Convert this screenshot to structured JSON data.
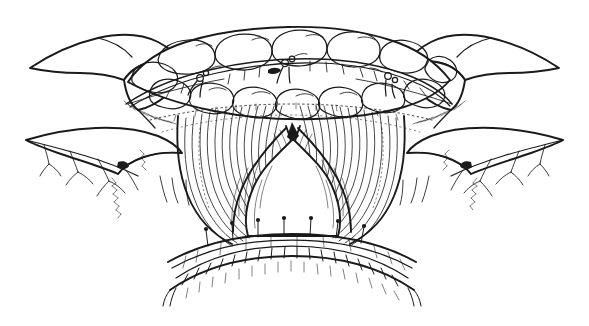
{
  "figure": {
    "kind": "line-art-medical-illustration",
    "background_color": "#ffffff",
    "ink_color": "#1a1a1a",
    "width": 589,
    "height": 326,
    "has_text_labels": false,
    "caption": "",
    "style": "pen-and-ink hatched line drawing, no shading fills, white background"
  },
  "regions": [
    {
      "id": "left-retractor-hand",
      "label": "Left retracting hand / finger pair",
      "description": "Two rounded finger forms entering from the upper-left, gripping and drawing the tissue edge laterally"
    },
    {
      "id": "right-retractor-hand",
      "label": "Right retracting hand / finger pair",
      "description": "Mirror-image rounded finger forms entering from the upper-right, drawing the tissue edge laterally"
    },
    {
      "id": "fat-pad-band",
      "label": "Lobulated fat pad / omental band",
      "description": "Arched band of overlapping rounded lobules spanning the top center of the field"
    },
    {
      "id": "upper-suture-line",
      "label": "Upper running suture with knots",
      "description": "Dark stitched line running through the lobulated band, with three tied knot clusters"
    },
    {
      "id": "muscular-wall",
      "label": "Striated muscular wall",
      "description": "Fan of fine vertical curved fibers descending from the band and sweeping around the opening"
    },
    {
      "id": "central-aperture",
      "label": "Central aperture / hiatus",
      "description": "Dome-shaped white opening at the center of the field with a sharp V-notch at its apex"
    },
    {
      "id": "lower-suture-line",
      "label": "Lower interrupted suture line",
      "description": "Gently arched line across the base of the aperture with upright interrupted stitches"
    },
    {
      "id": "inferior-stitch-ladder",
      "label": "Inferior stitch ladder",
      "description": "Second arched line below, carrying a ladder of rectangular stitch loops along its length"
    },
    {
      "id": "left-vessel-branches",
      "label": "Left branching vessels",
      "description": "Thin branching vessel and septal lines extending to the lower-left margin"
    },
    {
      "id": "right-vessel-branches",
      "label": "Right branching vessels",
      "description": "Thin branching vessel and septal lines extending to the lower-right margin"
    }
  ],
  "geometry": {
    "aperture_apex": [
      295,
      128
    ],
    "aperture_center": [
      292,
      190
    ],
    "aperture_width": 150,
    "aperture_height": 110,
    "upper_suture_knot_count": 3,
    "lower_suture_stitch_count": 7,
    "stitch_ladder_loop_count": 22
  },
  "chart_data": null
}
